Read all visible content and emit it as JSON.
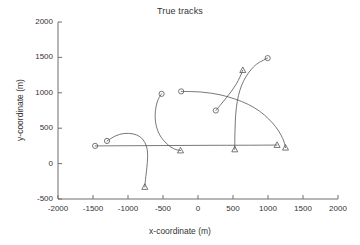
{
  "chart_data": {
    "type": "line",
    "title": "True tracks",
    "xlabel": "x-coordinate (m)",
    "ylabel": "y-coordinate (m)",
    "xlim": [
      -2000,
      2000
    ],
    "ylim": [
      -500,
      2000
    ],
    "xticks": [
      -2000,
      -1500,
      -1000,
      -500,
      0,
      500,
      1000,
      1500,
      2000
    ],
    "yticks": [
      -500,
      0,
      500,
      1000,
      1500,
      2000
    ],
    "xtick_labels": [
      "-2000",
      "-1500",
      "-1000",
      "-500",
      "0",
      "500",
      "1000",
      "1500",
      "2000"
    ],
    "ytick_labels": [
      "-500",
      "0",
      "500",
      "1000",
      "1500",
      "2000"
    ],
    "grid": false,
    "legend": null,
    "line_color": "#555555",
    "marker_start": "circle",
    "marker_end": "triangle",
    "series": [
      {
        "name": "track-1",
        "start_marker": "circle",
        "end_marker": "triangle",
        "start": [
          -1470,
          250
        ],
        "end": [
          1130,
          262
        ],
        "points": [
          [
            -1470,
            250
          ],
          [
            -1100,
            252
          ],
          [
            -700,
            254
          ],
          [
            -300,
            256
          ],
          [
            100,
            258
          ],
          [
            500,
            259
          ],
          [
            800,
            260
          ],
          [
            1130,
            262
          ]
        ]
      },
      {
        "name": "track-2",
        "start_marker": "circle",
        "end_marker": "triangle",
        "start": [
          -1300,
          320
        ],
        "end": [
          -760,
          -330
        ],
        "points": [
          [
            -1300,
            320
          ],
          [
            -1180,
            390
          ],
          [
            -1060,
            425
          ],
          [
            -930,
            420
          ],
          [
            -830,
            380
          ],
          [
            -760,
            300
          ],
          [
            -725,
            195
          ],
          [
            -720,
            80
          ],
          [
            -730,
            -50
          ],
          [
            -745,
            -180
          ],
          [
            -755,
            -270
          ],
          [
            -760,
            -330
          ]
        ]
      },
      {
        "name": "track-3",
        "start_marker": "circle",
        "end_marker": "triangle",
        "start": [
          -520,
          985
        ],
        "end": [
          -250,
          185
        ],
        "points": [
          [
            -520,
            985
          ],
          [
            -570,
            905
          ],
          [
            -600,
            800
          ],
          [
            -612,
            690
          ],
          [
            -605,
            575
          ],
          [
            -575,
            465
          ],
          [
            -525,
            370
          ],
          [
            -455,
            290
          ],
          [
            -385,
            232
          ],
          [
            -315,
            198
          ],
          [
            -250,
            185
          ]
        ]
      },
      {
        "name": "track-4",
        "start_marker": "circle",
        "end_marker": "triangle",
        "start": [
          -240,
          1020
        ],
        "end": [
          1250,
          225
        ],
        "points": [
          [
            -240,
            1020
          ],
          [
            50,
            1010
          ],
          [
            300,
            975
          ],
          [
            520,
            915
          ],
          [
            720,
            835
          ],
          [
            880,
            740
          ],
          [
            1010,
            630
          ],
          [
            1110,
            520
          ],
          [
            1185,
            405
          ],
          [
            1230,
            305
          ],
          [
            1250,
            225
          ]
        ]
      },
      {
        "name": "track-5",
        "start_marker": "triangle",
        "end_marker": "circle",
        "start": [
          525,
          200
        ],
        "end": [
          995,
          1490
        ],
        "points": [
          [
            525,
            200
          ],
          [
            527,
            400
          ],
          [
            533,
            600
          ],
          [
            548,
            790
          ],
          [
            578,
            960
          ],
          [
            625,
            1110
          ],
          [
            690,
            1235
          ],
          [
            770,
            1340
          ],
          [
            860,
            1420
          ],
          [
            995,
            1490
          ]
        ]
      },
      {
        "name": "track-6",
        "start_marker": "circle",
        "end_marker": "triangle",
        "start": [
          255,
          750
        ],
        "end": [
          640,
          1320
        ],
        "points": [
          [
            255,
            750
          ],
          [
            330,
            840
          ],
          [
            405,
            930
          ],
          [
            480,
            1025
          ],
          [
            545,
            1120
          ],
          [
            600,
            1225
          ],
          [
            640,
            1320
          ]
        ]
      }
    ]
  }
}
